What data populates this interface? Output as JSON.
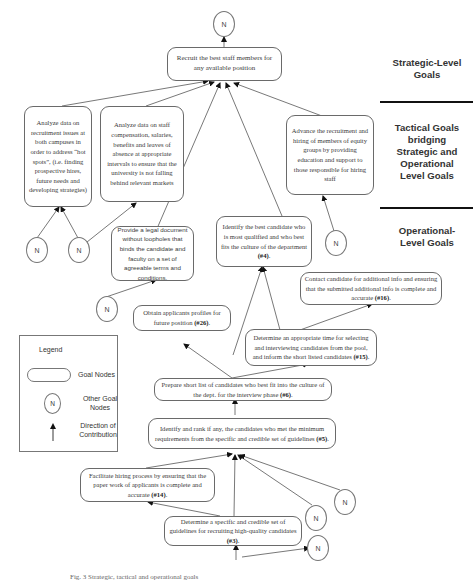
{
  "diagram": {
    "type": "goal-hierarchy",
    "levels": [
      {
        "id": "strategic",
        "label": "Strategic-Level Goals"
      },
      {
        "id": "tactical",
        "label": "Tactical Goals bridging Strategic and Operational Level Goals"
      },
      {
        "id": "operational",
        "label": "Operational-Level Goals"
      }
    ],
    "level_labels": {
      "strategic_1": "Strategic-Level",
      "strategic_2": "Goals",
      "tactical_1": "Tactical Goals",
      "tactical_2": "bridging",
      "tactical_3": "Strategic and",
      "tactical_4": "Operational",
      "tactical_5": "Level Goals",
      "operational_1": "Operational-",
      "operational_2": "Level Goals"
    },
    "nodes": {
      "strategic": {
        "text": "Recruit the best  staff members for any available position"
      },
      "tactical_hotspots": {
        "text": "Analyze data on recruitment issues at both campuses in order to address “hot spots”, (i.e. finding prospective hires, future needs and developing strategies)"
      },
      "tactical_compensation": {
        "text": "Analyze data on staff compensation, salaries, benefits and leaves of absence at appropriate intervals to ensure that the university is not falling behind relevant markets"
      },
      "tactical_equity": {
        "text": "Advance the recruitment and hiring of members of equity groups by providing education and support to those responsible for hiring staff"
      },
      "legal_document": {
        "text": "Provide a legal document without loopholes that binds the candidate and faculty on a set of agreeable terms and conditions."
      },
      "best_candidate": {
        "text": "Identify the best candidate who is most qualified and who best fits the culture of the department",
        "id_label": "(#4)",
        "suffix": "."
      },
      "contact_candidate": {
        "text": "Contact candidate for additional info and ensuring that the submitted additional info is complete and accurate",
        "id_label": "(#16)",
        "suffix": "."
      },
      "applicant_profiles": {
        "text": "Obtain applicants profiles for future position",
        "id_label": "(#26)",
        "suffix": "."
      },
      "determine_time": {
        "text": "Determine an appropriate time for selecting and interviewing candidates from the pool, and inform the short listed candidates",
        "id_label": "(#15)",
        "suffix": "."
      },
      "short_list": {
        "text": "Prepare short list of candidates who best fit into the culture of the dept. for the interview phase",
        "id_label": "(#6)",
        "suffix": "."
      },
      "rank_candidates": {
        "text": "Identify and rank if any, the candidates who met the minimum requirements from the specific and credible set of guidelines",
        "id_label": "(#5)",
        "suffix": "."
      },
      "facilitate_hiring": {
        "text": "Facilitate hiring process by ensuring that the paper work of applicants is complete and accurate",
        "id_label": "(#14)",
        "suffix": "."
      },
      "guidelines": {
        "text": "Determine  a specific and credible set of guidelines for recruiting high-quality candidates",
        "id_label": "(#3)",
        "suffix": "."
      }
    },
    "other_goal_node_label": "N",
    "legend": {
      "title": "Legend",
      "goal_nodes": "Goal Nodes",
      "other_goal_nodes": "Other Goal Nodes",
      "direction": "Direction of Contribution"
    },
    "caption": "Fig. 3  Strategic, tactical and operational goals"
  }
}
